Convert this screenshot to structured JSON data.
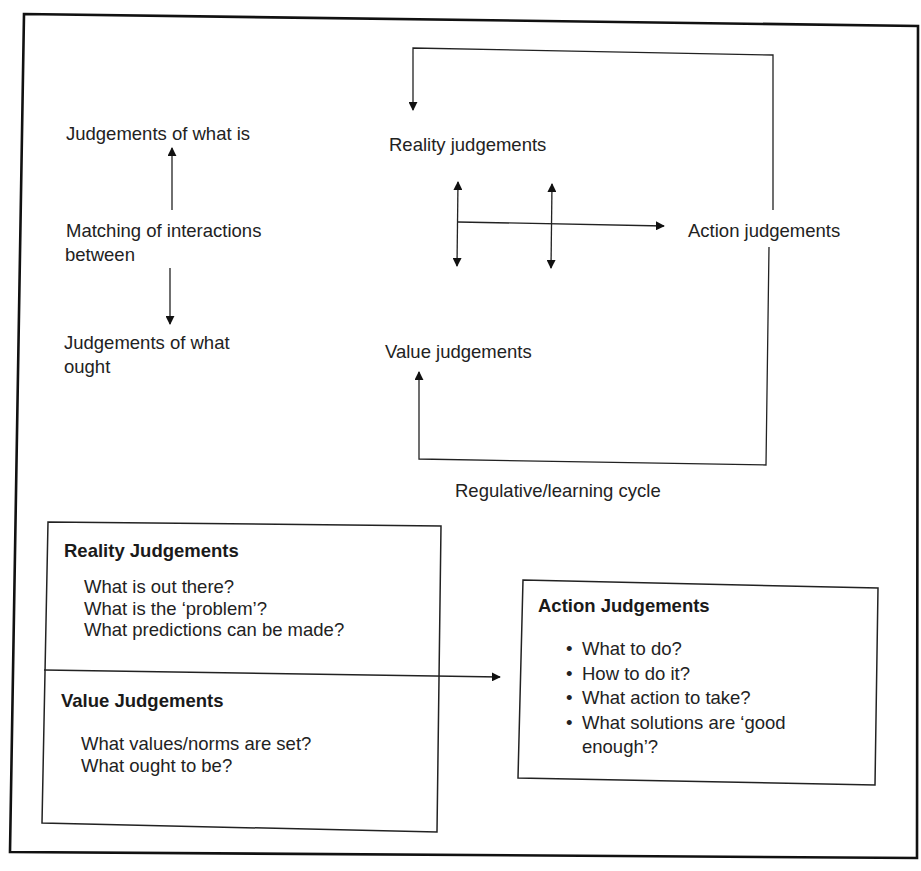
{
  "upper_left": {
    "top_label": "Judgements of what is",
    "middle_label_line1": "Matching of interactions",
    "middle_label_line2": "between",
    "bottom_label_line1": "Judgements of what",
    "bottom_label_line2": "ought"
  },
  "cycle": {
    "reality_label": "Reality judgements",
    "value_label": "Value judgements",
    "action_label": "Action judgements",
    "caption": "Regulative/learning cycle"
  },
  "reality_box": {
    "title": "Reality Judgements",
    "questions": [
      "What is out there?",
      "What is the ‘problem’?",
      "What predictions can be made?"
    ]
  },
  "value_box": {
    "title": "Value Judgements",
    "questions": [
      "What values/norms are set?",
      "What ought to be?"
    ]
  },
  "action_box": {
    "title": "Action Judgements",
    "bullets": [
      "What to do?",
      "How to do it?",
      "What action to take?",
      "What solutions are ‘good enough’?"
    ]
  },
  "colors": {
    "ink": "#1e1e1e",
    "background": "#ffffff"
  }
}
